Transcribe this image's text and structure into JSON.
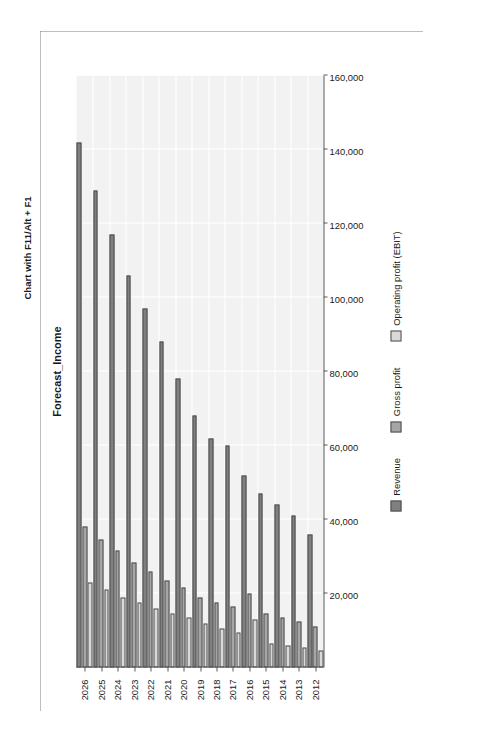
{
  "page": {
    "figure_label": "Figure 5.10",
    "caption": "Chart with F11/Alt + F1"
  },
  "legend": {
    "position": "bottom",
    "items": [
      {
        "label": "Revenue",
        "color": "#808080"
      },
      {
        "label": "Gross profit",
        "color": "#a6a6a6"
      },
      {
        "label": "Operating profit (EBIT)",
        "color": "#d9d9d9"
      }
    ]
  },
  "axis": {
    "value_ticks": [
      "160,000",
      "140,000",
      "120,000",
      "100,000",
      "80,000",
      "60,000",
      "40,000",
      "20,000"
    ],
    "category_ticks": [
      "2012",
      "2013",
      "2014",
      "2015",
      "2016",
      "2017",
      "2018",
      "2019",
      "2020",
      "2021",
      "2022",
      "2023",
      "2024",
      "2025",
      "2026"
    ]
  },
  "chart_data": {
    "type": "bar",
    "orientation": "horizontal",
    "title": "Forecast_Income",
    "xlabel": "",
    "ylabel": "",
    "xlim": [
      0,
      160000
    ],
    "xticks": [
      0,
      20000,
      40000,
      60000,
      80000,
      100000,
      120000,
      140000,
      160000
    ],
    "grid": true,
    "legend_position": "bottom",
    "categories": [
      "2012",
      "2013",
      "2014",
      "2015",
      "2016",
      "2017",
      "2018",
      "2019",
      "2020",
      "2021",
      "2022",
      "2023",
      "2024",
      "2025",
      "2026"
    ],
    "series": [
      {
        "name": "Revenue",
        "color": "#808080",
        "values": [
          36000,
          41000,
          44000,
          47000,
          52000,
          60000,
          62000,
          68000,
          78000,
          88000,
          97000,
          106000,
          117000,
          129000,
          142000
        ]
      },
      {
        "name": "Gross profit",
        "color": "#a6a6a6",
        "values": [
          11000,
          12500,
          13500,
          14500,
          20000,
          16500,
          17500,
          19000,
          21500,
          23500,
          26000,
          28500,
          31500,
          34500,
          38000
        ]
      },
      {
        "name": "Operating profit (EBIT)",
        "color": "#d9d9d9",
        "values": [
          4500,
          5500,
          6000,
          6500,
          13000,
          9500,
          10500,
          12000,
          13500,
          14500,
          16000,
          17500,
          19000,
          21000,
          23000
        ]
      }
    ]
  }
}
